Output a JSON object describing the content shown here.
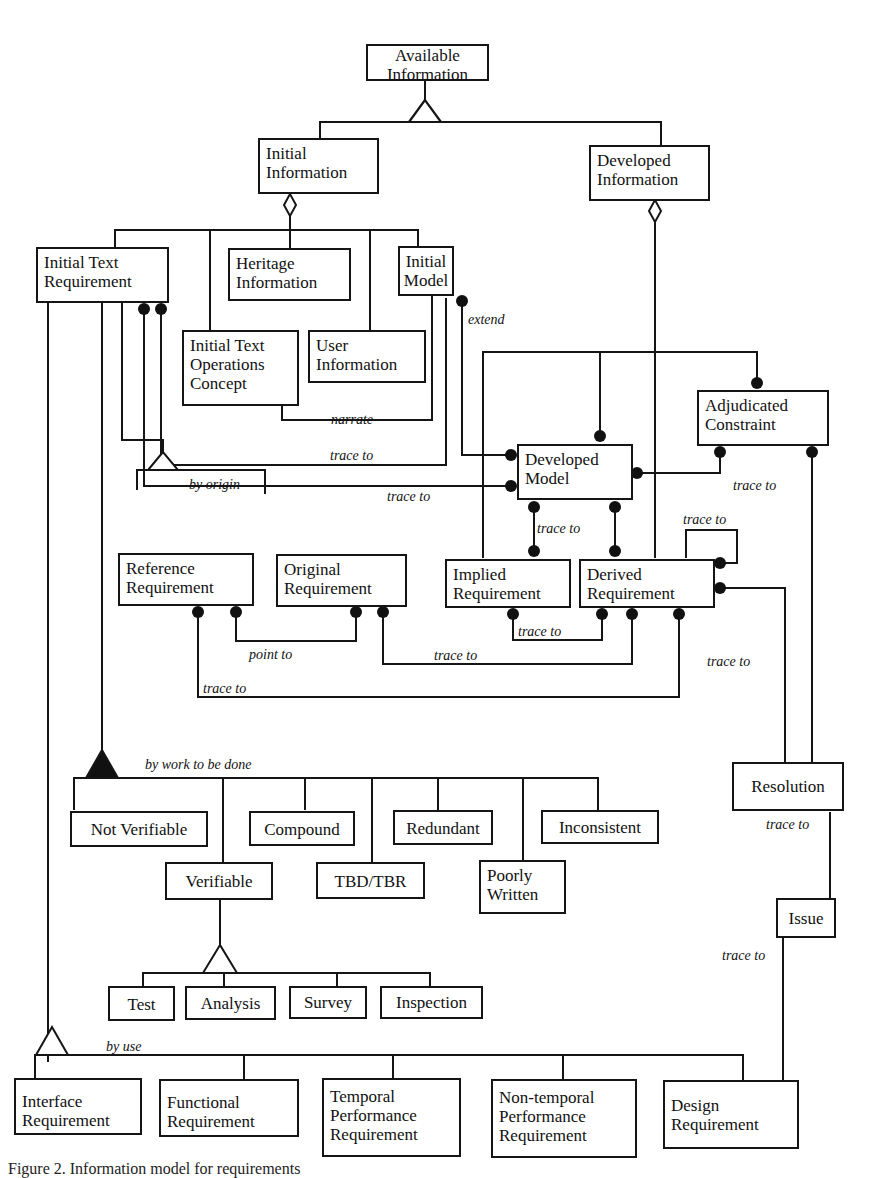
{
  "diagram": {
    "title": "Information model for requirements",
    "classes": {
      "available_information": "Available\nInformation",
      "initial_information": "Initial\nInformation",
      "developed_information": "Developed\nInformation",
      "initial_text_requirement": "Initial Text\nRequirement",
      "heritage_information": "Heritage\nInformation",
      "initial_model": "Initial\nModel",
      "initial_text_operations_concept": "Initial Text\nOperations\nConcept",
      "user_information": "User\nInformation",
      "adjudicated_constraint": "Adjudicated\nConstraint",
      "developed_model": "Developed\nModel",
      "reference_requirement": "Reference\nRequirement",
      "original_requirement": "Original\nRequirement",
      "implied_requirement": "Implied\nRequirement",
      "derived_requirement": "Derived\nRequirement",
      "resolution": "Resolution",
      "issue": "Issue",
      "not_verifiable": "Not Verifiable",
      "compound": "Compound",
      "redundant": "Redundant",
      "inconsistent": "Inconsistent",
      "verifiable": "Verifiable",
      "tbd_tbr": "TBD/TBR",
      "poorly_written": "Poorly\nWritten",
      "test": "Test",
      "analysis": "Analysis",
      "survey": "Survey",
      "inspection": "Inspection",
      "interface_requirement": "Interface\nRequirement",
      "functional_requirement": "Functional\nRequirement",
      "temporal_performance_requirement": "Temporal\nPerformance\nRequirement",
      "non_temporal_performance_requirement": "Non-temporal\nPerformance\nRequirement",
      "design_requirement": "Design\nRequirement"
    },
    "labels": {
      "extend": "extend",
      "narrate": "narrate",
      "trace_to_initial_model": "trace to",
      "trace_to_itr_dev_model": "trace to",
      "trace_to_adjudicated": "trace to",
      "by_origin": "by origin",
      "trace_to_dev_implied": "trace to",
      "trace_to_self": "trace to",
      "trace_to_implied_derived": "trace to",
      "point_to": "point to",
      "trace_to_original_derived": "trace to",
      "trace_to_reference_derived": "trace to",
      "trace_to_derived_resolution": "trace to",
      "by_work_to_be_done": "by work to be done",
      "trace_to_resolution_issue": "trace to",
      "trace_to_issue_design": "trace to",
      "by_use": "by use"
    },
    "caption": "Figure 2.  Information model for requirements"
  }
}
